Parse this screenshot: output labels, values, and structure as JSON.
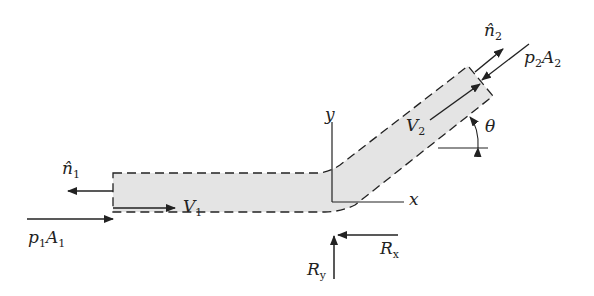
{
  "diagram": {
    "labels": {
      "n1": {
        "base": "n̂",
        "sub": "1"
      },
      "n2": {
        "base": "n̂",
        "sub": "2"
      },
      "V1": {
        "base": "V",
        "sub": "1"
      },
      "V2": {
        "base": "V",
        "sub": "2"
      },
      "p1A1": {
        "base": "p",
        "sub": "1",
        "base2": "A",
        "sub2": "1"
      },
      "p2A2": {
        "base": "p",
        "sub": "2",
        "base2": "A",
        "sub2": "2"
      },
      "Rx": {
        "base": "R",
        "sub": "x"
      },
      "Ry": {
        "base": "R",
        "sub": "y"
      },
      "x_axis": "x",
      "y_axis": "y",
      "theta": "θ"
    },
    "colors": {
      "fill": "#e4e4e4",
      "stroke": "#222222"
    }
  }
}
